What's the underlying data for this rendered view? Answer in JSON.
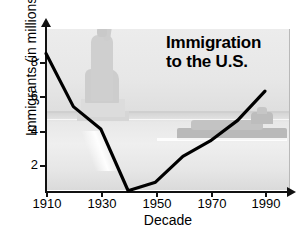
{
  "chart_data": {
    "type": "line",
    "title": "Immigration to the U.S.",
    "title_line1": "Immigration",
    "title_line2": "to the U.S.",
    "xlabel": "Decade",
    "ylabel": "Immigrants (in millions)",
    "x": [
      1910,
      1920,
      1930,
      1940,
      1950,
      1960,
      1970,
      1980,
      1990
    ],
    "values": [
      8.5,
      5.4,
      4.1,
      0.5,
      1.0,
      2.5,
      3.4,
      4.6,
      6.3
    ],
    "series": [
      {
        "name": "Immigrants (in millions)",
        "values": [
          8.5,
          5.4,
          4.1,
          0.5,
          1.0,
          2.5,
          3.4,
          4.6,
          6.3
        ]
      }
    ],
    "xticks": [
      "1910",
      "1930",
      "1950",
      "1970",
      "1990"
    ],
    "xtick_values": [
      1910,
      1930,
      1950,
      1970,
      1990
    ],
    "yticks": [
      "2",
      "4",
      "6",
      "8"
    ],
    "ytick_values": [
      2,
      4,
      6,
      8
    ],
    "xlim": [
      1910,
      1995
    ],
    "ylim": [
      0,
      9.4
    ],
    "grid": false,
    "legend": null,
    "line_color": "#000000",
    "line_width": 3.2,
    "plot_background": "#e6e6e6",
    "background_imagery": [
      "statue-of-liberty-silhouette",
      "ship-on-water-silhouette"
    ]
  },
  "axes": {
    "y": {
      "label": "Immigrants (in millions)",
      "ticks": [
        {
          "label": "8",
          "value": 8
        },
        {
          "label": "6",
          "value": 6
        },
        {
          "label": "4",
          "value": 4
        },
        {
          "label": "2",
          "value": 2
        }
      ]
    },
    "x": {
      "label": "Decade",
      "ticks": [
        {
          "label": "1910",
          "value": 1910
        },
        {
          "label": "1930",
          "value": 1930
        },
        {
          "label": "1950",
          "value": 1950
        },
        {
          "label": "1970",
          "value": 1970
        },
        {
          "label": "1990",
          "value": 1990
        }
      ]
    }
  }
}
